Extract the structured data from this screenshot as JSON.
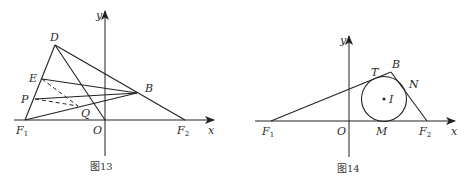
{
  "figures": [
    {
      "caption": "图13",
      "axes": {
        "x_label": "x",
        "y_label": "y"
      },
      "points": {
        "D": "D",
        "E": "E",
        "P": "P",
        "Q": "Q",
        "B": "B",
        "O": "O",
        "F1": "F",
        "F1_sub": "1",
        "F2": "F",
        "F2_sub": "2"
      },
      "segments": [
        "F1-D",
        "D-F2",
        "D-O",
        "E-B",
        "P-B",
        "F1-B"
      ],
      "dashed_segments": [
        "E-Q",
        "P-Q"
      ]
    },
    {
      "caption": "图14",
      "axes": {
        "x_label": "x",
        "y_label": "y"
      },
      "points": {
        "T": "T",
        "B": "B",
        "N": "N",
        "I": "I",
        "O": "O",
        "M": "M",
        "F1": "F",
        "F1_sub": "1",
        "F2": "F",
        "F2_sub": "2"
      },
      "segments": [
        "F1-B",
        "B-F2"
      ],
      "circle": {
        "center": "I",
        "tangent_points": [
          "T",
          "N",
          "M"
        ]
      }
    }
  ]
}
